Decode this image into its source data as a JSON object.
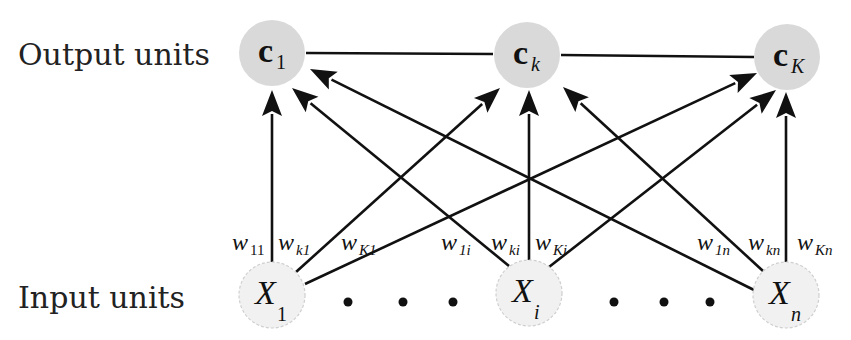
{
  "labels": {
    "output_row": "Output units",
    "input_row": "Input units"
  },
  "colors": {
    "output_fill": "#d9d9d9",
    "input_fill": "#f1f1f1",
    "input_stroke": "#cfcfcf",
    "edge": "#111111"
  },
  "output_nodes": [
    {
      "id": "c1",
      "main": "c",
      "sub": "1",
      "sub_italic": false,
      "cx": 272,
      "cy": 53
    },
    {
      "id": "ck",
      "main": "c",
      "sub": "k",
      "sub_italic": true,
      "cx": 527,
      "cy": 55
    },
    {
      "id": "cK",
      "main": "c",
      "sub": "K",
      "sub_italic": true,
      "cx": 787,
      "cy": 57
    }
  ],
  "input_nodes": [
    {
      "id": "X1",
      "main": "X",
      "sub": "1",
      "sub_italic": false,
      "cx": 272,
      "cy": 295
    },
    {
      "id": "Xi",
      "main": "X",
      "sub": "i",
      "sub_italic": true,
      "cx": 529,
      "cy": 293
    },
    {
      "id": "Xn",
      "main": "X",
      "sub": "n",
      "sub_italic": true,
      "cx": 786,
      "cy": 295
    }
  ],
  "ellipsis_dots": [
    {
      "x": 348,
      "y": 302
    },
    {
      "x": 403,
      "y": 302
    },
    {
      "x": 453,
      "y": 302
    },
    {
      "x": 614,
      "y": 302
    },
    {
      "x": 664,
      "y": 302
    },
    {
      "x": 710,
      "y": 302
    }
  ],
  "weights": [
    {
      "from": "X1",
      "to": "c1",
      "main": "w",
      "sub": "11",
      "x": 232,
      "y": 250
    },
    {
      "from": "X1",
      "to": "ck",
      "main": "w",
      "sub": "k1",
      "x": 278,
      "y": 250
    },
    {
      "from": "X1",
      "to": "cK",
      "main": "w",
      "sub": "K1",
      "x": 341,
      "y": 250
    },
    {
      "from": "Xi",
      "to": "c1",
      "main": "w",
      "sub": "1i",
      "x": 441,
      "y": 250
    },
    {
      "from": "Xi",
      "to": "ck",
      "main": "w",
      "sub": "ki",
      "x": 491,
      "y": 250
    },
    {
      "from": "Xi",
      "to": "cK",
      "main": "w",
      "sub": "Ki",
      "x": 535,
      "y": 250
    },
    {
      "from": "Xn",
      "to": "c1",
      "main": "w",
      "sub": "1n",
      "x": 697,
      "y": 250
    },
    {
      "from": "Xn",
      "to": "ck",
      "main": "w",
      "sub": "kn",
      "x": 748,
      "y": 250
    },
    {
      "from": "Xn",
      "to": "cK",
      "main": "w",
      "sub": "Kn",
      "x": 797,
      "y": 250
    }
  ],
  "edges": [
    {
      "x1": 272,
      "y1": 262,
      "x2": 272,
      "y2": 90
    },
    {
      "x1": 296,
      "y1": 272,
      "x2": 500,
      "y2": 88
    },
    {
      "x1": 305,
      "y1": 284,
      "x2": 757,
      "y2": 73
    },
    {
      "x1": 509,
      "y1": 266,
      "x2": 292,
      "y2": 88
    },
    {
      "x1": 529,
      "y1": 260,
      "x2": 529,
      "y2": 90
    },
    {
      "x1": 549,
      "y1": 267,
      "x2": 776,
      "y2": 90
    },
    {
      "x1": 754,
      "y1": 290,
      "x2": 310,
      "y2": 69
    },
    {
      "x1": 763,
      "y1": 271,
      "x2": 563,
      "y2": 87
    },
    {
      "x1": 786,
      "y1": 262,
      "x2": 786,
      "y2": 92
    }
  ],
  "lateral_connections": [
    {
      "x1": 306,
      "y1": 53,
      "x2": 493,
      "y2": 54
    },
    {
      "x1": 561,
      "y1": 55,
      "x2": 754,
      "y2": 57
    }
  ]
}
